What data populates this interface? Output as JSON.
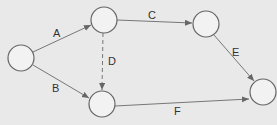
{
  "diagram": {
    "type": "activity-on-arrow network",
    "colors": {
      "background": "#e9e9e9",
      "node_fill": "#f2f2f2",
      "stroke": "#666666",
      "text": "#333333"
    },
    "nodes": [
      {
        "id": "n1",
        "cx": 21,
        "cy": 58
      },
      {
        "id": "n2",
        "cx": 104,
        "cy": 20
      },
      {
        "id": "n3",
        "cx": 102,
        "cy": 104
      },
      {
        "id": "n4",
        "cx": 206,
        "cy": 24
      },
      {
        "id": "n5",
        "cx": 263,
        "cy": 92
      }
    ],
    "edges": [
      {
        "label": "A",
        "from": "n1",
        "to": "n2",
        "dashed": false
      },
      {
        "label": "B",
        "from": "n1",
        "to": "n3",
        "dashed": false
      },
      {
        "label": "C",
        "from": "n2",
        "to": "n4",
        "dashed": false
      },
      {
        "label": "D",
        "from": "n2",
        "to": "n3",
        "dashed": true
      },
      {
        "label": "E",
        "from": "n4",
        "to": "n5",
        "dashed": false
      },
      {
        "label": "F",
        "from": "n3",
        "to": "n5",
        "dashed": false
      }
    ]
  }
}
